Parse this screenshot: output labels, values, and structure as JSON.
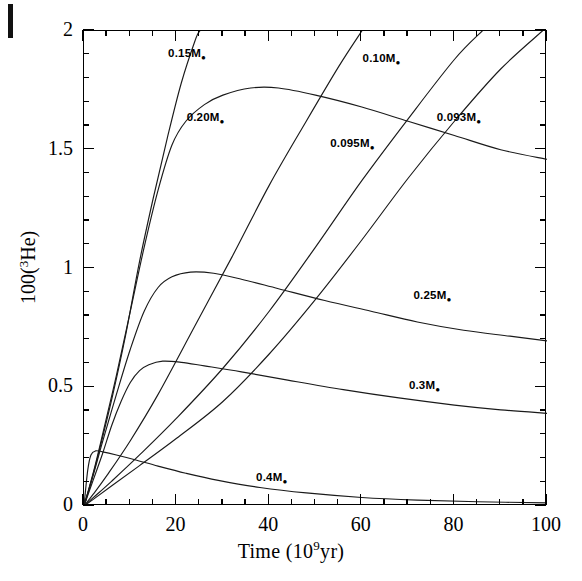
{
  "figure": {
    "background_color": "#ffffff",
    "line_color": "#1a1a1a",
    "axis_color": "#000000"
  },
  "axes": {
    "x_title_main": "Time  (10",
    "x_title_sup": "9",
    "x_title_tail": "yr)",
    "y_title_main": "100(",
    "y_title_sup": "3",
    "y_title_tail": "He)"
  },
  "chart_data": {
    "type": "line",
    "title": "",
    "xlabel": "Time (10^9 yr)",
    "ylabel": "100(3He)",
    "xlim": [
      0,
      100
    ],
    "ylim": [
      0,
      2
    ],
    "grid": false,
    "legend": "inline-curve-labels",
    "xticks": [
      0,
      20,
      40,
      60,
      80,
      100
    ],
    "xticklabels": [
      "0",
      "20",
      "40",
      "60",
      "80",
      "100"
    ],
    "xminor_step": 5,
    "yticks": [
      0,
      0.5,
      1,
      1.5,
      2
    ],
    "yticklabels": [
      "0",
      "0.5",
      "1",
      "1.5",
      "2"
    ],
    "yminor_step": 0.1,
    "series": [
      {
        "name": "0.093M",
        "label": "0.093M⊙",
        "label_x": 82,
        "label_y": 1.63,
        "points": [
          [
            0,
            0
          ],
          [
            2,
            0.028
          ],
          [
            6,
            0.085
          ],
          [
            12,
            0.17
          ],
          [
            20,
            0.285
          ],
          [
            30,
            0.44
          ],
          [
            40,
            0.64
          ],
          [
            50,
            0.87
          ],
          [
            60,
            1.12
          ],
          [
            70,
            1.38
          ],
          [
            80,
            1.62
          ],
          [
            90,
            1.84
          ],
          [
            99,
            2.0
          ]
        ]
      },
      {
        "name": "0.095M",
        "label": "0.095M⊙",
        "label_x": 59,
        "label_y": 1.52,
        "points": [
          [
            0,
            0
          ],
          [
            2,
            0.035
          ],
          [
            6,
            0.105
          ],
          [
            12,
            0.215
          ],
          [
            20,
            0.37
          ],
          [
            30,
            0.58
          ],
          [
            40,
            0.82
          ],
          [
            50,
            1.09
          ],
          [
            60,
            1.37
          ],
          [
            70,
            1.63
          ],
          [
            80,
            1.88
          ],
          [
            86,
            2.0
          ]
        ]
      },
      {
        "name": "0.10M",
        "label": "0.10M⊙",
        "label_x": 66,
        "label_y": 1.88,
        "points": [
          [
            0,
            0
          ],
          [
            2,
            0.05
          ],
          [
            5,
            0.13
          ],
          [
            10,
            0.275
          ],
          [
            16,
            0.47
          ],
          [
            24,
            0.76
          ],
          [
            32,
            1.05
          ],
          [
            40,
            1.35
          ],
          [
            48,
            1.62
          ],
          [
            55,
            1.85
          ],
          [
            60,
            2.0
          ]
        ]
      },
      {
        "name": "0.15M",
        "label": "0.15M⊙",
        "label_x": 24,
        "label_y": 1.9,
        "points": [
          [
            0,
            0
          ],
          [
            1.5,
            0.1
          ],
          [
            3,
            0.21
          ],
          [
            6,
            0.45
          ],
          [
            9,
            0.72
          ],
          [
            12,
            1.03
          ],
          [
            15,
            1.3
          ],
          [
            18,
            1.55
          ],
          [
            21,
            1.78
          ],
          [
            24,
            1.96
          ],
          [
            25,
            2.0
          ]
        ]
      },
      {
        "name": "0.20M",
        "label": "0.20M⊙",
        "label_x": 28,
        "label_y": 1.63,
        "points": [
          [
            0,
            0
          ],
          [
            2,
            0.14
          ],
          [
            4,
            0.3
          ],
          [
            7,
            0.55
          ],
          [
            10,
            0.82
          ],
          [
            13,
            1.09
          ],
          [
            16,
            1.33
          ],
          [
            19,
            1.52
          ],
          [
            22,
            1.62
          ],
          [
            26,
            1.69
          ],
          [
            30,
            1.73
          ],
          [
            36,
            1.76
          ],
          [
            42,
            1.76
          ],
          [
            50,
            1.73
          ],
          [
            60,
            1.68
          ],
          [
            70,
            1.62
          ],
          [
            80,
            1.56
          ],
          [
            90,
            1.5
          ],
          [
            100,
            1.46
          ]
        ]
      },
      {
        "name": "0.25M",
        "label": "0.25M⊙",
        "label_x": 77,
        "label_y": 0.88,
        "points": [
          [
            0,
            0
          ],
          [
            2,
            0.13
          ],
          [
            4,
            0.27
          ],
          [
            7,
            0.47
          ],
          [
            10,
            0.66
          ],
          [
            13,
            0.82
          ],
          [
            16,
            0.92
          ],
          [
            19,
            0.965
          ],
          [
            23,
            0.985
          ],
          [
            28,
            0.98
          ],
          [
            34,
            0.955
          ],
          [
            42,
            0.915
          ],
          [
            52,
            0.865
          ],
          [
            62,
            0.82
          ],
          [
            72,
            0.775
          ],
          [
            82,
            0.74
          ],
          [
            92,
            0.715
          ],
          [
            100,
            0.695
          ]
        ]
      },
      {
        "name": "0.3M",
        "label": "0.3M⊙",
        "label_x": 76,
        "label_y": 0.5,
        "points": [
          [
            0,
            0
          ],
          [
            2,
            0.11
          ],
          [
            4,
            0.22
          ],
          [
            6,
            0.34
          ],
          [
            8,
            0.44
          ],
          [
            10,
            0.52
          ],
          [
            12,
            0.57
          ],
          [
            14,
            0.595
          ],
          [
            17,
            0.61
          ],
          [
            21,
            0.605
          ],
          [
            26,
            0.59
          ],
          [
            34,
            0.565
          ],
          [
            44,
            0.53
          ],
          [
            56,
            0.49
          ],
          [
            68,
            0.455
          ],
          [
            80,
            0.425
          ],
          [
            90,
            0.405
          ],
          [
            100,
            0.39
          ]
        ]
      },
      {
        "name": "0.4M",
        "label": "0.4M⊙",
        "label_x": 43,
        "label_y": 0.115,
        "points": [
          [
            0,
            0
          ],
          [
            0.8,
            0.15
          ],
          [
            1.5,
            0.215
          ],
          [
            2.5,
            0.232
          ],
          [
            4,
            0.228
          ],
          [
            7,
            0.215
          ],
          [
            11,
            0.195
          ],
          [
            16,
            0.168
          ],
          [
            22,
            0.138
          ],
          [
            29,
            0.108
          ],
          [
            38,
            0.078
          ],
          [
            48,
            0.055
          ],
          [
            60,
            0.036
          ],
          [
            72,
            0.025
          ],
          [
            85,
            0.018
          ],
          [
            100,
            0.013
          ]
        ]
      }
    ]
  }
}
